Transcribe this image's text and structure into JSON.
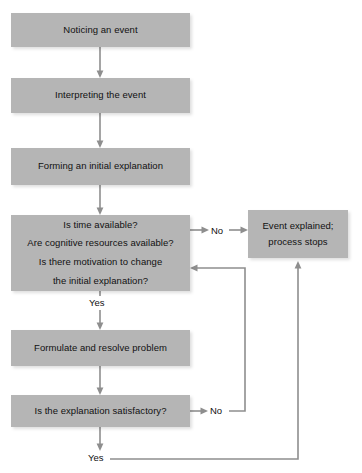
{
  "diagram": {
    "box_color": "#b5b5b5",
    "edge_color": "#8e8e8e",
    "text_color": "#111111",
    "nodes": [
      {
        "id": "noticing",
        "lines": [
          "Noticing an event"
        ]
      },
      {
        "id": "interpreting",
        "lines": [
          "Interpreting the event"
        ]
      },
      {
        "id": "forming",
        "lines": [
          "Forming an initial explanation"
        ]
      },
      {
        "id": "conditions",
        "lines": [
          "Is time available?",
          "Are cognitive resources available?",
          "Is there motivation to change",
          "the initial explanation?"
        ]
      },
      {
        "id": "formulate",
        "lines": [
          "Formulate and resolve problem"
        ]
      },
      {
        "id": "satisfactory",
        "lines": [
          "Is the explanation satisfactory?"
        ]
      },
      {
        "id": "explained",
        "lines": [
          "Event explained;",
          "process stops"
        ]
      }
    ],
    "edge_labels": {
      "no_top": "No",
      "no_bottom": "No",
      "yes_middle": "Yes",
      "yes_bottom": "Yes"
    }
  }
}
